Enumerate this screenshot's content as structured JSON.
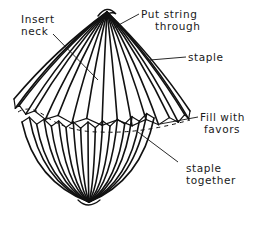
{
  "diagram": {
    "colors": {
      "ink": "#111111",
      "background": "#ffffff"
    },
    "labels": [
      {
        "id": "insert-neck",
        "lines": [
          "Insert",
          "neck"
        ]
      },
      {
        "id": "put-string-through",
        "lines": [
          "Put string",
          "through"
        ]
      },
      {
        "id": "staple",
        "lines": [
          "staple"
        ]
      },
      {
        "id": "fill-with-favors",
        "lines": [
          "Fill with",
          "favors"
        ]
      },
      {
        "id": "staple-together",
        "lines": [
          "staple",
          "together"
        ]
      }
    ]
  }
}
